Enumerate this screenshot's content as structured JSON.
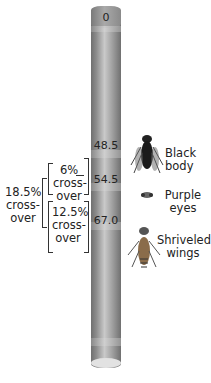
{
  "chromosome": {
    "top_label": "0",
    "loci": [
      {
        "position": "48.5",
        "trait": "Black body"
      },
      {
        "position": "54.5",
        "trait": "Purple eyes"
      },
      {
        "position": "67.0",
        "trait": "Shriveled wings"
      }
    ]
  },
  "traits": {
    "black": {
      "line1": "Black",
      "line2": "body"
    },
    "purple": {
      "line1": "Purple",
      "line2": "eyes"
    },
    "wings": {
      "line1": "Shriveled",
      "line2": "wings"
    }
  },
  "crossovers": {
    "outer": {
      "pct": "18.5%",
      "l2": "cross-",
      "l3": "over"
    },
    "upper": {
      "pct": "6%",
      "l2": "cross-",
      "l3": "over"
    },
    "lower": {
      "pct": "12.5%",
      "l2": "cross-",
      "l3": "over"
    }
  }
}
